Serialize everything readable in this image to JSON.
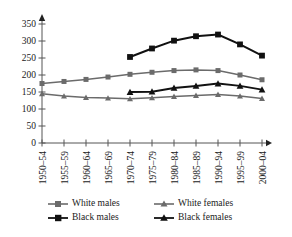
{
  "chart_data": {
    "type": "line",
    "title": "",
    "subtitle": "",
    "xlabel": "",
    "ylabel": "",
    "ylim": [
      0,
      350
    ],
    "yticks": [
      0,
      50,
      100,
      150,
      200,
      250,
      300,
      350
    ],
    "grid": false,
    "legend_position": "bottom",
    "categories": [
      "1950–54",
      "1955–59",
      "1960–64",
      "1965–69",
      "1970–74",
      "1975–79",
      "1980–84",
      "1985–89",
      "1990–94",
      "1995–99",
      "2000–04"
    ],
    "series": [
      {
        "name": "White males",
        "color": "#6b6b6b",
        "marker": "square",
        "values": [
          175,
          181,
          187,
          194,
          202,
          208,
          213,
          215,
          213,
          200,
          186
        ]
      },
      {
        "name": "White females",
        "color": "#6b6b6b",
        "marker": "triangle",
        "values": [
          145,
          138,
          134,
          132,
          130,
          133,
          137,
          140,
          143,
          138,
          131
        ]
      },
      {
        "name": "Black males",
        "color": "#111111",
        "marker": "square",
        "values": [
          null,
          null,
          null,
          null,
          253,
          278,
          301,
          314,
          319,
          290,
          257
        ]
      },
      {
        "name": "Black females",
        "color": "#111111",
        "marker": "triangle",
        "values": [
          null,
          null,
          null,
          null,
          150,
          151,
          162,
          168,
          175,
          168,
          157
        ]
      }
    ]
  },
  "axis": {
    "tick_labels_y": [
      "0",
      "50",
      "100",
      "150",
      "200",
      "250",
      "300",
      "350"
    ],
    "tick_labels_x": [
      "1950–54",
      "1955–59",
      "1960–64",
      "1965–69",
      "1970–74",
      "1975–79",
      "1980–84",
      "1985–89",
      "1990–94",
      "1995–99",
      "2000–04"
    ],
    "axis_color": "#555555"
  },
  "legend": {
    "items": [
      {
        "label": "White males",
        "color": "#6b6b6b",
        "marker": "square"
      },
      {
        "label": "White females",
        "color": "#6b6b6b",
        "marker": "triangle"
      },
      {
        "label": "Black males",
        "color": "#111111",
        "marker": "square"
      },
      {
        "label": "Black females",
        "color": "#111111",
        "marker": "triangle"
      }
    ]
  }
}
